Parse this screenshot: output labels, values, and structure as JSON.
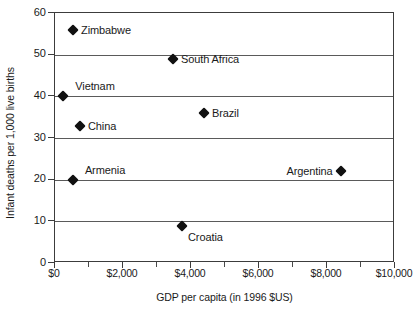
{
  "chart_data": {
    "type": "scatter",
    "title": "",
    "xlabel": "GDP per capita  (in 1996 $US)",
    "ylabel": "Infant deaths per 1,000 live births",
    "xlim": [
      0,
      10000
    ],
    "ylim": [
      0,
      60
    ],
    "grid": "horizontal",
    "legend": "none",
    "x_tick_labels": [
      "$0",
      "$2,000",
      "$4,000",
      "$6,000",
      "$8,000",
      "$10,000"
    ],
    "x_tick_values": [
      0,
      2000,
      4000,
      6000,
      8000,
      10000
    ],
    "x_minor_tick_values": [
      1000,
      3000,
      5000,
      7000,
      9000
    ],
    "y_tick_labels": [
      "0",
      "10",
      "20",
      "30",
      "40",
      "50",
      "60"
    ],
    "y_tick_values": [
      0,
      10,
      20,
      30,
      40,
      50,
      60
    ],
    "marker": "diamond",
    "marker_color": "#111111",
    "points": [
      {
        "label": "Zimbabwe",
        "x": 530,
        "y": 56,
        "label_pos": "right"
      },
      {
        "label": "South Africa",
        "x": 3470,
        "y": 49,
        "label_pos": "right"
      },
      {
        "label": "Vietnam",
        "x": 235,
        "y": 40,
        "label_pos": "above"
      },
      {
        "label": "Brazil",
        "x": 4380,
        "y": 36,
        "label_pos": "right"
      },
      {
        "label": "China",
        "x": 735,
        "y": 33,
        "label_pos": "right"
      },
      {
        "label": "Armenia",
        "x": 530,
        "y": 20,
        "label_pos": "above"
      },
      {
        "label": "Argentina",
        "x": 8400,
        "y": 22,
        "label_pos": "left"
      },
      {
        "label": "Croatia",
        "x": 3735,
        "y": 9,
        "label_pos": "below-right"
      }
    ]
  },
  "axes": {
    "x_title": "GDP per capita  (in 1996 $US)",
    "y_title": "Infant deaths per 1,000 live births"
  }
}
